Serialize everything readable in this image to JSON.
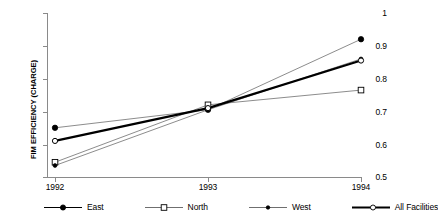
{
  "chart_data": {
    "type": "line",
    "title": "",
    "xlabel": "",
    "ylabel": "FIM EFFICIENCY (CHARGE)",
    "categories": [
      "1992",
      "1993",
      "1994"
    ],
    "x_tick_labels": [
      "1992",
      "1993",
      "1994"
    ],
    "y_tick_labels": [
      "0.5",
      "0.6",
      "0.7",
      "0.8",
      "0.9",
      "1"
    ],
    "y_ticks": [
      0.5,
      0.6,
      0.7,
      0.8,
      0.9,
      1
    ],
    "ylim": [
      0.5,
      1
    ],
    "grid": false,
    "legend_position": "bottom",
    "series": [
      {
        "name": "East",
        "marker": "filled-circle",
        "line_width": 0.8,
        "color": "#000000",
        "values": [
          0.65,
          0.705,
          0.92
        ]
      },
      {
        "name": "North",
        "marker": "open-square",
        "line_width": 0.8,
        "color": "#000000",
        "values": [
          0.545,
          0.72,
          0.765
        ]
      },
      {
        "name": "West",
        "marker": "filled-circle-small",
        "line_width": 0.8,
        "color": "#000000",
        "values": [
          0.535,
          0.705,
          0.86
        ]
      },
      {
        "name": "All Facilities",
        "marker": "open-circle",
        "line_width": 2.2,
        "color": "#000000",
        "values": [
          0.61,
          0.71,
          0.855
        ]
      }
    ]
  },
  "axis": {
    "y_title": "FIM EFFICIENCY (CHARGE)",
    "y_labels": [
      "1",
      "0.9",
      "0.8",
      "0.7",
      "0.6",
      "0.5"
    ],
    "x_labels": [
      "1992",
      "1993",
      "1994"
    ]
  },
  "legend": {
    "items": [
      {
        "label": "East"
      },
      {
        "label": "North"
      },
      {
        "label": "West"
      },
      {
        "label": "All Facilities"
      }
    ]
  },
  "colors": {
    "axis": "#8a8a8a",
    "series_line": "#7d7d7d",
    "bold_line": "#000000",
    "marker_fill": "#000000",
    "marker_open": "#ffffff",
    "background": "#ffffff"
  }
}
